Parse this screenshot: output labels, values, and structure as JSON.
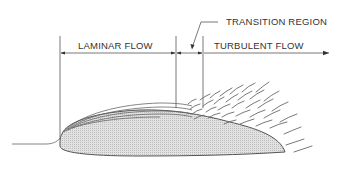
{
  "diagram": {
    "labels": {
      "laminar": "LAMINAR FLOW",
      "transition": "TRANSITION REGION",
      "turbulent": "TURBULENT FLOW"
    },
    "colors": {
      "line": "#555555",
      "airfoil_fill": "#d9d9d9",
      "text": "#333333"
    }
  }
}
